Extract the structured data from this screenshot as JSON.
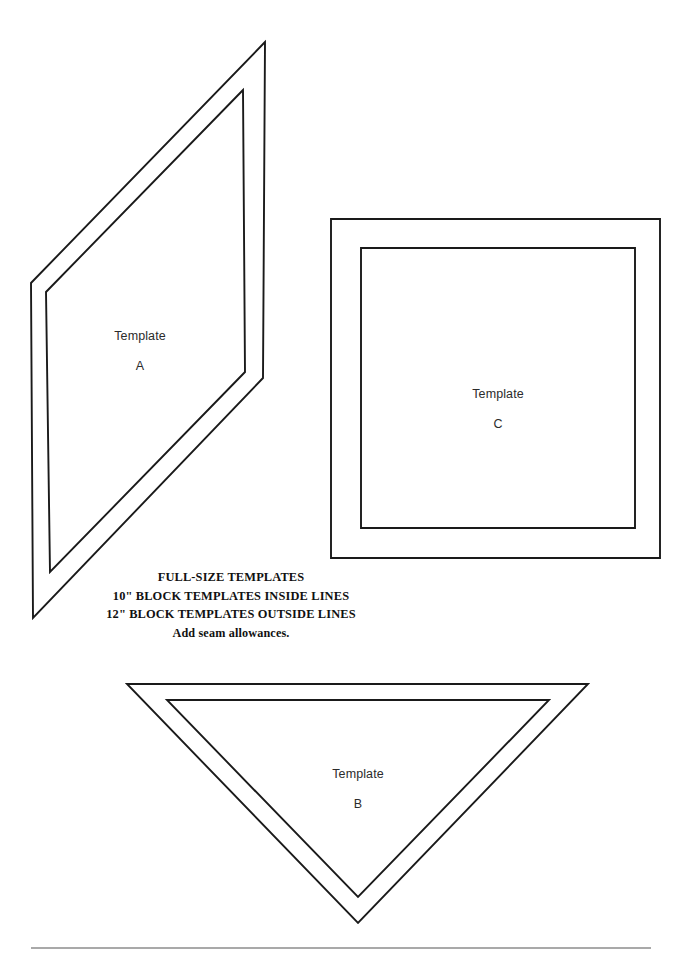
{
  "page": {
    "background_color": "#ffffff",
    "ink_color": "#1a1a1a",
    "width": 682,
    "height": 971
  },
  "templates": [
    {
      "id": "A",
      "name": "template-a",
      "shape": "parallelogram",
      "label_line_1": "Template",
      "label_line_2": "A",
      "outer_points": "265,42 31,283 33,618 263,378",
      "inner_points": "243,90 46,292 50,572 245,372"
    },
    {
      "id": "C",
      "name": "template-c",
      "shape": "square",
      "label_line_1": "Template",
      "label_line_2": "C",
      "outer_points": "331,219 660,219 660,558 331,558",
      "inner_points": "361,248 635,248 635,528 361,528"
    },
    {
      "id": "B",
      "name": "template-b",
      "shape": "triangle",
      "label_line_1": "Template",
      "label_line_2": "B",
      "outer_points": "127,684 588,684 358,923",
      "inner_points": "167,700 549,700 358,897"
    }
  ],
  "instructions": {
    "line_1": "FULL-SIZE TEMPLATES",
    "line_2": "10\" BLOCK TEMPLATES INSIDE LINES",
    "line_3": "12\" BLOCK TEMPLATES OUTSIDE LINES",
    "line_4": "Add seam allowances."
  },
  "footer": {
    "divider": {
      "x1": 31,
      "x2": 651,
      "y": 948,
      "color": "#555555"
    }
  }
}
